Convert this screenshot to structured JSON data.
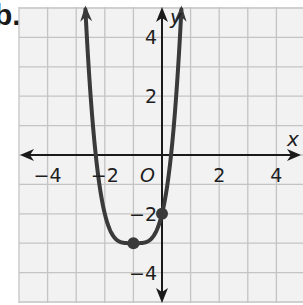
{
  "problem_label": "b.",
  "chart_data": {
    "type": "line",
    "title": "",
    "xlabel": "x",
    "ylabel": "y",
    "xlim": [
      -5,
      5
    ],
    "ylim": [
      -5,
      5
    ],
    "grid": true,
    "x_ticks": [
      -4,
      -2,
      2,
      4
    ],
    "x_tick_labels": [
      "−4",
      "−2",
      "2",
      "4"
    ],
    "y_ticks": [
      4,
      2,
      -2,
      -4
    ],
    "y_tick_labels": [
      "4",
      "2",
      "−2",
      "−4"
    ],
    "origin_label": "O",
    "series": [
      {
        "name": "curve",
        "description": "quartic-shaped curve opening upward with arrows at both ends",
        "equation_estimate": "y = (x + 1)^4 - 3",
        "x_intercepts_estimate": [
          -2.32,
          0.32
        ],
        "key_points": [
          {
            "x": -1,
            "y": -3,
            "label": "vertex (minimum)"
          },
          {
            "x": 0,
            "y": -2,
            "label": "y-intercept"
          }
        ],
        "color": "#3a3a3a"
      }
    ],
    "legend": "none"
  },
  "colors": {
    "grid": "#c4c4c4",
    "axis": "#1a1a1a",
    "curve": "#3a3a3a",
    "background": "#f2f2f2"
  }
}
